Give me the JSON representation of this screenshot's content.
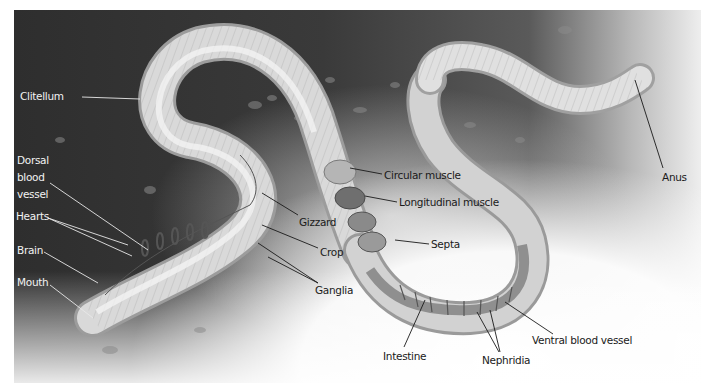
{
  "figure": {
    "colors": {
      "soil_dark": "#2a2a2a",
      "soil_mid": "#6e6e6e",
      "worm_body": "#d9d9d9",
      "worm_highlight": "#f1f1f1",
      "label_on_dark": "#f2f2f2",
      "label_on_light": "#1a1a1a"
    },
    "labels": {
      "clitellum": "Clitellum",
      "dorsal_line1": "Dorsal",
      "dorsal_line2": "blood",
      "dorsal_line3": "vessel",
      "hearts": "Hearts",
      "brain": "Brain",
      "mouth": "Mouth",
      "gizzard": "Gizzard",
      "crop": "Crop",
      "ganglia": "Ganglia",
      "circular_muscle": "Circular muscle",
      "longitudinal_muscle": "Longitudinal muscle",
      "septa": "Septa",
      "intestine": "Intestine",
      "nephridia": "Nephridia",
      "ventral_blood_vessel": "Ventral blood vessel",
      "anus": "Anus"
    }
  }
}
